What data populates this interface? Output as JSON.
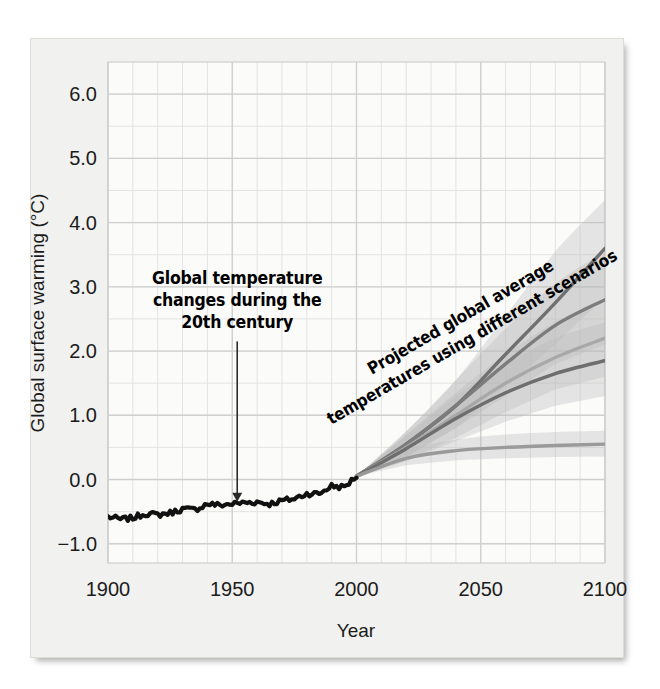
{
  "figure": {
    "background_color": "#f1f1ef",
    "plot_background_color": "#fbfbfa",
    "grid_color": "#cfcfcf",
    "minor_grid_color": "#e3e3e1",
    "historical_color": "#111111",
    "projection_colors": [
      "#707070",
      "#7c7c7c",
      "#a8a8a8",
      "#6e6e6e",
      "#9a9a9a"
    ],
    "band_color": "#b9b9b9"
  },
  "axes": {
    "y_label": "Global surface warming (°C)",
    "x_label": "Year",
    "y_ticks": [
      "6.0",
      "5.0",
      "4.0",
      "3.0",
      "2.0",
      "1.0",
      "0.0",
      "-1.0"
    ],
    "y_tick_values": [
      6.0,
      5.0,
      4.0,
      3.0,
      2.0,
      1.0,
      0.0,
      -1.0
    ],
    "x_ticks": [
      "1900",
      "1950",
      "2000",
      "2050",
      "2100"
    ],
    "x_tick_values": [
      1900,
      1950,
      2000,
      2050,
      2100
    ],
    "ylim": [
      -1.3,
      6.5
    ],
    "xlim": [
      1900,
      2100
    ],
    "grid": true,
    "minor_grid_step_x": 10,
    "minor_grid_step_y": 0.5
  },
  "annotations": [
    {
      "name": "historical-annotation",
      "lines": [
        "Global temperature",
        "changes during the",
        "20th century"
      ],
      "arrow": true,
      "arrow_from_year": 1952,
      "arrow_from_value": 2.15,
      "arrow_to_year": 1952,
      "arrow_to_value": -0.33
    },
    {
      "name": "projection-annotation",
      "lines": [
        "Projected global average",
        "temperatures using different scenarios"
      ],
      "rotation_deg": -30
    }
  ],
  "chart_data": {
    "type": "line",
    "title": "",
    "xlabel": "Year",
    "ylabel": "Global surface warming (°C)",
    "xlim": [
      1900,
      2100
    ],
    "ylim": [
      -1.3,
      6.5
    ],
    "grid": true,
    "legend": "none",
    "series": [
      {
        "name": "Observed global temperature (20th century)",
        "kind": "historical",
        "color": "#111111",
        "x": [
          1900,
          1905,
          1910,
          1915,
          1920,
          1925,
          1930,
          1935,
          1940,
          1945,
          1950,
          1955,
          1960,
          1965,
          1970,
          1975,
          1980,
          1985,
          1990,
          1995,
          2000
        ],
        "values": [
          -0.58,
          -0.62,
          -0.6,
          -0.53,
          -0.55,
          -0.52,
          -0.46,
          -0.47,
          -0.38,
          -0.4,
          -0.38,
          -0.36,
          -0.35,
          -0.38,
          -0.33,
          -0.3,
          -0.22,
          -0.22,
          -0.1,
          -0.12,
          0.05
        ]
      },
      {
        "name": "Scenario A2 (highest)",
        "kind": "projection",
        "color": "#707070",
        "x": [
          2000,
          2020,
          2040,
          2060,
          2080,
          2100
        ],
        "values": [
          0.05,
          0.55,
          1.15,
          1.95,
          2.75,
          3.6
        ],
        "band_low": [
          0.05,
          0.35,
          0.8,
          1.45,
          2.1,
          2.85
        ],
        "band_high": [
          0.05,
          0.75,
          1.55,
          2.55,
          3.55,
          4.35
        ]
      },
      {
        "name": "Scenario A1B",
        "kind": "projection",
        "color": "#7c7c7c",
        "x": [
          2000,
          2020,
          2040,
          2060,
          2080,
          2100
        ],
        "values": [
          0.05,
          0.55,
          1.15,
          1.8,
          2.4,
          2.8
        ],
        "band_low": [
          0.05,
          0.35,
          0.8,
          1.3,
          1.8,
          2.1
        ],
        "band_high": [
          0.05,
          0.75,
          1.55,
          2.35,
          3.05,
          3.55
        ]
      },
      {
        "name": "Scenario B2",
        "kind": "projection",
        "color": "#a8a8a8",
        "x": [
          2000,
          2020,
          2040,
          2060,
          2080,
          2100
        ],
        "values": [
          0.05,
          0.5,
          1.0,
          1.5,
          1.9,
          2.2
        ],
        "band_low": [
          0.05,
          0.3,
          0.65,
          1.05,
          1.4,
          1.6
        ],
        "band_high": [
          0.05,
          0.7,
          1.35,
          1.95,
          2.45,
          2.8
        ]
      },
      {
        "name": "Scenario B1",
        "kind": "projection",
        "color": "#6e6e6e",
        "x": [
          2000,
          2020,
          2040,
          2060,
          2080,
          2100
        ],
        "values": [
          0.05,
          0.48,
          0.95,
          1.35,
          1.65,
          1.85
        ],
        "band_low": [
          0.05,
          0.28,
          0.6,
          0.9,
          1.15,
          1.3
        ],
        "band_high": [
          0.05,
          0.68,
          1.3,
          1.8,
          2.2,
          2.45
        ]
      },
      {
        "name": "Constant year-2000 concentrations",
        "kind": "projection",
        "color": "#9a9a9a",
        "x": [
          2000,
          2020,
          2040,
          2060,
          2080,
          2100
        ],
        "values": [
          0.05,
          0.33,
          0.45,
          0.5,
          0.53,
          0.55
        ],
        "band_low": [
          0.05,
          0.22,
          0.3,
          0.33,
          0.35,
          0.36
        ],
        "band_high": [
          0.05,
          0.45,
          0.62,
          0.7,
          0.74,
          0.76
        ]
      }
    ]
  }
}
